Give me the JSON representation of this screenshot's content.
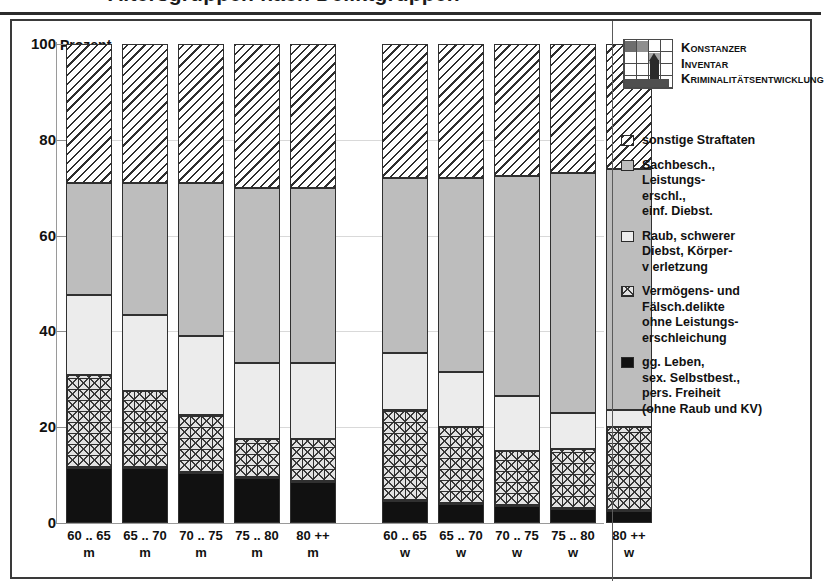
{
  "title": "Altersgruppen nach Deliktgruppen",
  "frame": {
    "y_axis_title": "Prozent"
  },
  "logo": {
    "icon": "konstanz-tower-icon",
    "line1": "Konstanzer",
    "line2": "Inventar",
    "line3": "Kriminalitätsentwicklung"
  },
  "legend": {
    "items": [
      {
        "key": "sonstige",
        "swatch": "diagonal-hatch-swatch",
        "label": "sonstige Straftaten"
      },
      {
        "key": "sachbesch",
        "swatch": "medium-gray-swatch",
        "label": "Sachbesch.,\nLeistungs-\nerschl.,\neinf. Diebst."
      },
      {
        "key": "raub",
        "swatch": "light-gray-swatch",
        "label": "Raub, schwerer\nDiebst, Körper-\nv erletzung"
      },
      {
        "key": "vermoegen",
        "swatch": "checkered-swatch",
        "label": "Vermögens- und\nFälsch.delikte\nohne Leistungs-\nerschleichung"
      },
      {
        "key": "ggleben",
        "swatch": "solid-black-swatch",
        "label": "gg. Leben,\nsex. Selbstbest.,\npers. Freiheit\n(ohne Raub und KV)"
      }
    ]
  },
  "chart_data": {
    "type": "bar",
    "subtype": "stacked-100-percent",
    "title": "Altersgruppen nach Deliktgruppen",
    "xlabel": "",
    "ylabel": "Prozent",
    "ylim": [
      0,
      100
    ],
    "yticks": [
      0,
      20,
      40,
      60,
      80,
      100
    ],
    "grid": true,
    "legend_position": "right",
    "categories": [
      {
        "line1": "60 .. 65",
        "line2": "m",
        "group": "m"
      },
      {
        "line1": "65 .. 70",
        "line2": "m",
        "group": "m"
      },
      {
        "line1": "70 .. 75",
        "line2": "m",
        "group": "m"
      },
      {
        "line1": "75 .. 80",
        "line2": "m",
        "group": "m"
      },
      {
        "line1": "80 ++",
        "line2": "m",
        "group": "m"
      },
      {
        "line1": "60 .. 65",
        "line2": "w",
        "group": "w"
      },
      {
        "line1": "65 .. 70",
        "line2": "w",
        "group": "w"
      },
      {
        "line1": "70 .. 75",
        "line2": "w",
        "group": "w"
      },
      {
        "line1": "75 .. 80",
        "line2": "w",
        "group": "w"
      },
      {
        "line1": "80 ++",
        "line2": "w",
        "group": "w"
      }
    ],
    "series": [
      {
        "name": "gg. Leben, sex. Selbstbest., pers. Freiheit (ohne Raub und KV)",
        "key": "ggleben",
        "values": [
          11.5,
          11.5,
          10.5,
          9.5,
          8.5,
          4.5,
          4.0,
          3.5,
          3.0,
          2.5
        ]
      },
      {
        "name": "Vermögens- und Fälsch.delikte ohne Leistungserschleichung",
        "key": "vermoegen",
        "values": [
          19.5,
          16.0,
          12.0,
          8.0,
          9.0,
          19.0,
          16.0,
          11.5,
          12.5,
          17.5
        ]
      },
      {
        "name": "Raub, schwerer Diebst, Körperverletzung",
        "key": "raub",
        "values": [
          16.5,
          16.0,
          16.5,
          16.0,
          16.0,
          12.0,
          11.5,
          11.5,
          7.5,
          3.5
        ]
      },
      {
        "name": "Sachbesch., Leistungserschl., einf. Diebst.",
        "key": "sachbesch",
        "values": [
          23.5,
          27.5,
          32.0,
          36.5,
          36.5,
          36.5,
          40.5,
          46.0,
          50.0,
          50.5
        ]
      },
      {
        "name": "sonstige Straftaten",
        "key": "sonstige",
        "values": [
          29.0,
          29.0,
          29.0,
          30.0,
          30.0,
          28.0,
          28.0,
          27.5,
          27.0,
          26.0
        ]
      }
    ],
    "colors": {
      "ggleben": "#111111",
      "vermoegen": "#e2e2e2",
      "raub": "#ececec",
      "sachbesch": "#bdbdbd",
      "sonstige": "#ffffff"
    }
  }
}
